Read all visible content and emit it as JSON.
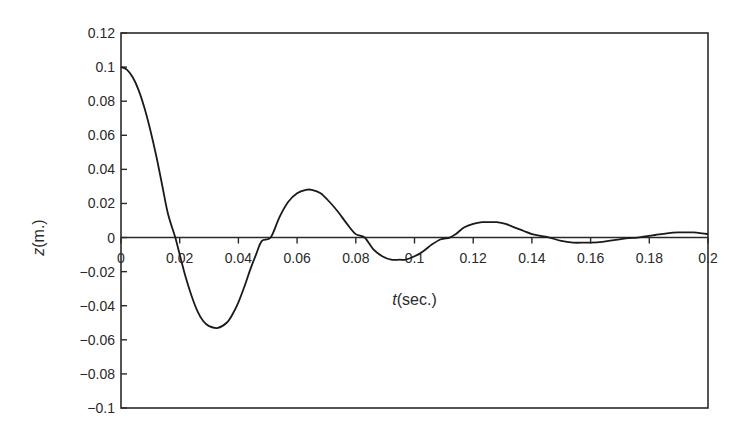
{
  "chart_data": {
    "type": "line",
    "title": "",
    "xlabel": "t(sec.)",
    "xlabel_italic_part": "t",
    "xlabel_rest": "(sec.)",
    "ylabel": "z(m.)",
    "ylabel_italic_part": "z",
    "ylabel_rest": "(m.)",
    "xlim": [
      0,
      0.2
    ],
    "ylim": [
      -0.1,
      0.12
    ],
    "grid": false,
    "legend": null,
    "x_ticks": [
      0,
      0.02,
      0.04,
      0.06,
      0.08,
      0.1,
      0.12,
      0.14,
      0.16,
      0.18,
      0.2
    ],
    "x_tick_labels": [
      "0",
      "0.02",
      "0.04",
      "0.06",
      "0.08",
      "0.1",
      "0.12",
      "0.14",
      "0.16",
      "0.18",
      "0.2"
    ],
    "y_ticks": [
      0.12,
      0.1,
      0.08,
      0.06,
      0.04,
      0.02,
      0,
      -0.02,
      -0.04,
      -0.06,
      -0.08,
      -0.1
    ],
    "y_tick_labels": [
      "0.12",
      "0.1",
      "0.08",
      "0.06",
      "0.04",
      "0.02",
      "0",
      "−0.02",
      "−0.04",
      "−0.06",
      "−0.08",
      "−0.1"
    ],
    "x_axis_at_zero": true,
    "series": [
      {
        "name": "z(t)",
        "color": "#1a1a1a",
        "x": [
          0,
          0.002,
          0.004,
          0.006,
          0.008,
          0.01,
          0.012,
          0.014,
          0.016,
          0.0185,
          0.02,
          0.022,
          0.024,
          0.026,
          0.028,
          0.03,
          0.033,
          0.036,
          0.038,
          0.04,
          0.042,
          0.044,
          0.046,
          0.048,
          0.051,
          0.054,
          0.057,
          0.06,
          0.063,
          0.065,
          0.068,
          0.071,
          0.074,
          0.077,
          0.08,
          0.083,
          0.086,
          0.089,
          0.092,
          0.095,
          0.097,
          0.1,
          0.103,
          0.106,
          0.109,
          0.112,
          0.114,
          0.117,
          0.12,
          0.123,
          0.126,
          0.128,
          0.131,
          0.134,
          0.137,
          0.14,
          0.143,
          0.146,
          0.15,
          0.154,
          0.158,
          0.16,
          0.164,
          0.168,
          0.172,
          0.176,
          0.178,
          0.182,
          0.186,
          0.19,
          0.195,
          0.198,
          0.2
        ],
        "y": [
          0.1,
          0.0985,
          0.094,
          0.0865,
          0.076,
          0.063,
          0.048,
          0.031,
          0.014,
          0.0,
          -0.01,
          -0.023,
          -0.034,
          -0.043,
          -0.049,
          -0.052,
          -0.053,
          -0.05,
          -0.045,
          -0.038,
          -0.029,
          -0.019,
          -0.01,
          -0.002,
          0.0,
          0.012,
          0.021,
          0.026,
          0.028,
          0.028,
          0.026,
          0.021,
          0.015,
          0.008,
          0.002,
          0.0,
          -0.007,
          -0.011,
          -0.013,
          -0.013,
          -0.013,
          -0.011,
          -0.008,
          -0.004,
          -0.001,
          0.0,
          0.002,
          0.006,
          0.008,
          0.009,
          0.009,
          0.009,
          0.008,
          0.006,
          0.004,
          0.002,
          0.001,
          0.0,
          -0.002,
          -0.003,
          -0.003,
          -0.003,
          -0.0025,
          -0.0015,
          -0.0005,
          0.0,
          0.0005,
          0.0015,
          0.0025,
          0.003,
          0.003,
          0.0025,
          0.002
        ]
      }
    ],
    "frame": {
      "left_px": 121,
      "top_px": 33,
      "right_px": 708,
      "bottom_px": 408
    }
  }
}
